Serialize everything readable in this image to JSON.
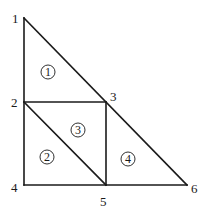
{
  "diagram": {
    "type": "finite-element-mesh",
    "nodes": [
      {
        "id": "1",
        "x": 24,
        "y": 18,
        "label_x": 12,
        "label_y": 23
      },
      {
        "id": "2",
        "x": 24,
        "y": 102,
        "label_x": 11,
        "label_y": 107
      },
      {
        "id": "3",
        "x": 106,
        "y": 102,
        "label_x": 110,
        "label_y": 101
      },
      {
        "id": "4",
        "x": 24,
        "y": 185,
        "label_x": 11,
        "label_y": 192
      },
      {
        "id": "5",
        "x": 106,
        "y": 185,
        "label_x": 100,
        "label_y": 206
      },
      {
        "id": "6",
        "x": 187,
        "y": 185,
        "label_x": 191,
        "label_y": 193
      }
    ],
    "elements": [
      {
        "id": "1",
        "label": "1",
        "nodes": [
          "1",
          "2",
          "3"
        ],
        "cx": 48,
        "cy": 72
      },
      {
        "id": "2",
        "label": "2",
        "nodes": [
          "2",
          "4",
          "5"
        ],
        "cx": 47,
        "cy": 157
      },
      {
        "id": "3",
        "label": "3",
        "nodes": [
          "2",
          "5",
          "3"
        ],
        "cx": 78,
        "cy": 130
      },
      {
        "id": "4",
        "label": "4",
        "nodes": [
          "3",
          "5",
          "6"
        ],
        "cx": 128,
        "cy": 159
      }
    ],
    "edges": [
      [
        "1",
        "4"
      ],
      [
        "1",
        "6"
      ],
      [
        "4",
        "6"
      ],
      [
        "2",
        "3"
      ],
      [
        "3",
        "5"
      ],
      [
        "2",
        "5"
      ]
    ],
    "colors": {
      "line": "#1a1a1a",
      "background": "#ffffff"
    }
  }
}
